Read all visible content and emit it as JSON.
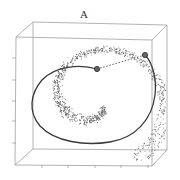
{
  "chart_data": {
    "type": "scatter",
    "subtype": "3d-scatter-swiss-roll",
    "title": "A",
    "xlabel": "",
    "ylabel": "",
    "zlabel": "",
    "grid": false,
    "legend": null,
    "box": {
      "front": {
        "x0": 16,
        "y0": 37,
        "x1": 152,
        "y1": 166
      },
      "back": {
        "x0": 33,
        "y0": 22,
        "x1": 167,
        "y1": 150
      }
    },
    "left_ticks_y": [
      58,
      80,
      101,
      121,
      143
    ],
    "bottom_ticks_x": [
      42,
      68,
      95,
      121,
      148
    ],
    "markers": [
      {
        "name": "point-1",
        "x": 97,
        "y": 69
      },
      {
        "name": "point-2",
        "x": 145,
        "y": 55
      }
    ],
    "geodesic_path": "solid curve along manifold from point-1 around roll to point-2",
    "euclidean_path": "dashed straight line between point-1 and point-2",
    "approx_point_count": 1000,
    "colors": {
      "points": "#555555",
      "curve": "#444444",
      "box": "#9a9a9a",
      "marker": "#333333"
    }
  }
}
